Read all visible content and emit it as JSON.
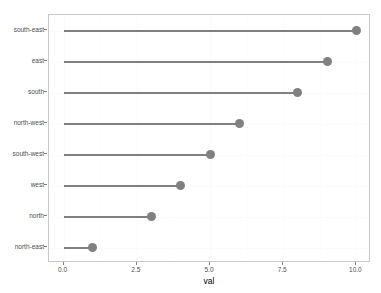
{
  "chart_data": {
    "type": "scatter",
    "plot_style": "lollipop",
    "title": "",
    "subtitle": "",
    "xlabel": "val",
    "ylabel": "",
    "categories": [
      "south-east",
      "east",
      "south",
      "north-west",
      "south-west",
      "west",
      "north",
      "north-east"
    ],
    "values": [
      10,
      9,
      8,
      6,
      5,
      4,
      3,
      1
    ],
    "points": [
      {
        "category": "south-east",
        "val": 10
      },
      {
        "category": "east",
        "val": 9
      },
      {
        "category": "south",
        "val": 8
      },
      {
        "category": "north-west",
        "val": 6
      },
      {
        "category": "south-west",
        "val": 5
      },
      {
        "category": "west",
        "val": 4
      },
      {
        "category": "north",
        "val": 3
      },
      {
        "category": "north-east",
        "val": 1
      }
    ],
    "xlim": [
      -0.5,
      10.5
    ],
    "x_ticks": [
      0,
      2.5,
      5,
      7.5,
      10
    ],
    "x_tick_labels": [
      "0.0",
      "2.5",
      "5.0",
      "7.5",
      "10.0"
    ],
    "y_tick_labels": [
      "south-east",
      "east",
      "south",
      "north-west",
      "south-west",
      "west",
      "north",
      "north-east"
    ],
    "segment_start": 0,
    "grid": true,
    "legend": "none",
    "colors": {
      "point": "#808080",
      "segment": "#808080",
      "panel_background": "#ffffff",
      "panel_border": "#c9c9c9",
      "grid_major": "#fbfbfb",
      "axis_text": "#4d4d4d",
      "axis_title": "#000000"
    }
  }
}
